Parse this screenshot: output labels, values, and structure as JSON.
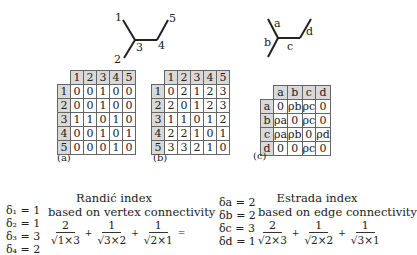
{
  "graph_vertices": {
    "labels": [
      "1",
      "2",
      "3",
      "4",
      "5"
    ]
  },
  "graph_edges": {
    "labels": [
      "a",
      "b",
      "c",
      "d"
    ]
  },
  "matrix_a": {
    "caption": "(a)",
    "headers": [
      "1",
      "2",
      "3",
      "4",
      "5"
    ],
    "rows": [
      {
        "h": "1",
        "cells": [
          "0",
          "0",
          "1",
          "0",
          "0"
        ]
      },
      {
        "h": "2",
        "cells": [
          "0",
          "0",
          "1",
          "0",
          "0"
        ]
      },
      {
        "h": "3",
        "cells": [
          "1",
          "1",
          "0",
          "1",
          "0"
        ]
      },
      {
        "h": "4",
        "cells": [
          "0",
          "0",
          "1",
          "0",
          "1"
        ]
      },
      {
        "h": "5",
        "cells": [
          "0",
          "0",
          "0",
          "1",
          "0"
        ]
      }
    ]
  },
  "matrix_b": {
    "caption": "(b)",
    "headers": [
      "1",
      "2",
      "3",
      "4",
      "5"
    ],
    "rows": [
      {
        "h": "1",
        "cells": [
          "0",
          "2",
          "1",
          "2",
          "3"
        ]
      },
      {
        "h": "2",
        "cells": [
          "2",
          "0",
          "1",
          "2",
          "3"
        ]
      },
      {
        "h": "3",
        "cells": [
          "1",
          "1",
          "0",
          "1",
          "2"
        ]
      },
      {
        "h": "4",
        "cells": [
          "2",
          "2",
          "1",
          "0",
          "1"
        ]
      },
      {
        "h": "5",
        "cells": [
          "3",
          "3",
          "2",
          "1",
          "0"
        ]
      }
    ]
  },
  "matrix_c": {
    "caption": "(c)",
    "headers": [
      "a",
      "b",
      "c",
      "d"
    ],
    "rows": [
      {
        "h": "a",
        "cells": [
          "0",
          "ρb",
          "ρc",
          "0"
        ]
      },
      {
        "h": "b",
        "cells": [
          "ρa",
          "0",
          "ρc",
          "0"
        ]
      },
      {
        "h": "c",
        "cells": [
          "ρa",
          "ρb",
          "0",
          "ρd"
        ]
      },
      {
        "h": "d",
        "cells": [
          "0",
          "0",
          "ρc",
          "0"
        ]
      }
    ]
  },
  "randic": {
    "title1": "Randić index",
    "title2": "based on vertex connectivity",
    "deltas": [
      "δ₁ = 1",
      "δ₂ = 1",
      "δ₃ = 3",
      "δ₄ = 2"
    ],
    "terms": [
      {
        "num": "2",
        "den": "√1×3"
      },
      {
        "num": "1",
        "den": "√3×2"
      },
      {
        "num": "1",
        "den": "√2×1"
      }
    ],
    "plus": "+",
    "equals": "="
  },
  "estrada": {
    "title1": "Estrada index",
    "title2": "based on edge connectivity",
    "deltas": [
      "δa = 2",
      "δb = 2",
      "δc = 3",
      "δd = 1"
    ],
    "terms": [
      {
        "num": "2",
        "den": "√2×3"
      },
      {
        "num": "1",
        "den": "√2×2"
      },
      {
        "num": "1",
        "den": "√3×1"
      }
    ],
    "plus": "+"
  }
}
